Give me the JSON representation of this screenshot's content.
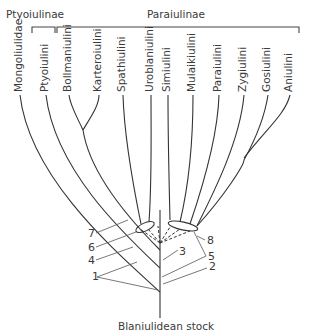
{
  "groups": {
    "ptyoiulinae": "Ptyoiulinae",
    "paraiulinae": "Paraiulinae"
  },
  "taxa": [
    "Mongoliulidae",
    "Ptyoiulini",
    "Bollmaniulini",
    "Karteroiulini",
    "Spathiulini",
    "Uroblaniulini",
    "Simiulini",
    "Mulaikiulini",
    "Paraiulini",
    "Zygiulini",
    "Gosiulini",
    "Aniulini"
  ],
  "character_markers": [
    "1",
    "2",
    "3",
    "4",
    "5",
    "6",
    "7",
    "8"
  ],
  "root_label": "Blaniulidean stock",
  "colors": {
    "line": "#333333",
    "text": "#3a3a3a",
    "background": "#ffffff"
  }
}
